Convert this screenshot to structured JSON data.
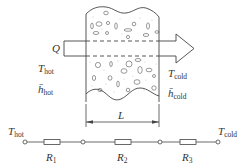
{
  "diagram": {
    "type": "porous-wall-heat-transfer-with-thermal-resistance-circuit",
    "wall": {
      "heat_flow_label": "Q",
      "left_side": {
        "temperature": {
          "symbol": "T",
          "subscript": "hot"
        },
        "heat_transfer_coefficient": {
          "symbol": "h̄",
          "subscript": "hot"
        }
      },
      "right_side": {
        "temperature": {
          "symbol": "T",
          "subscript": "cold"
        },
        "heat_transfer_coefficient": {
          "symbol": "h̄",
          "subscript": "cold"
        }
      },
      "thickness_label": "L"
    },
    "circuit": {
      "start_node": {
        "symbol": "T",
        "subscript": "hot"
      },
      "end_node": {
        "symbol": "T",
        "subscript": "cold"
      },
      "resistors": [
        {
          "symbol": "R",
          "subscript": "1"
        },
        {
          "symbol": "R",
          "subscript": "2"
        },
        {
          "symbol": "R",
          "subscript": "3"
        }
      ]
    }
  },
  "colors": {
    "line": "#444444",
    "text": "#333333",
    "background": "#ffffff"
  }
}
